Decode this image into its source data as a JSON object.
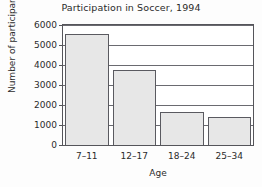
{
  "chart_data": {
    "type": "bar",
    "title": "Participation in Soccer, 1994",
    "xlabel": "Age",
    "ylabel": "Number of participants",
    "categories": [
      "7–11",
      "12–17",
      "18–24",
      "25–34"
    ],
    "values": [
      5550,
      3730,
      1650,
      1400
    ],
    "ylim": [
      0,
      6000
    ],
    "yticks": [
      0,
      1000,
      2000,
      3000,
      4000,
      5000,
      6000
    ],
    "ytick_labels": [
      "0",
      "1000",
      "2000",
      "3000",
      "4000",
      "5000",
      "6000"
    ],
    "grid": "horizontal",
    "legend": "none",
    "bar_fill_color": "#e7e7e7",
    "bar_edge_color": "#5a5a60",
    "axis_color": "#55555a",
    "background_color": "#ffffff"
  },
  "axis": {
    "y_label_0": "0",
    "y_label_1000": "1000",
    "y_label_2000": "2000",
    "y_label_3000": "3000",
    "y_label_4000": "4000",
    "y_label_5000": "5000",
    "y_label_6000": "6000"
  }
}
